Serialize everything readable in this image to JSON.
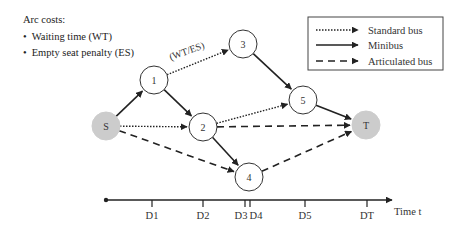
{
  "arc_costs": {
    "title": "Arc costs:",
    "items": [
      "Waiting time (WT)",
      "Empty seat penalty (ES)"
    ]
  },
  "edge_label": "(WT/ES)",
  "legend": {
    "items": [
      {
        "style": "dotted",
        "label": "Standard bus"
      },
      {
        "style": "solid",
        "label": "Minibus"
      },
      {
        "style": "dashed",
        "label": "Articulated bus"
      }
    ]
  },
  "nodes": [
    {
      "id": "S",
      "label": "S",
      "x": 106,
      "y": 126,
      "fill": "#cccccc"
    },
    {
      "id": "1",
      "label": "1",
      "x": 154,
      "y": 80,
      "fill": "#ffffff"
    },
    {
      "id": "2",
      "label": "2",
      "x": 203,
      "y": 127,
      "fill": "#ffffff"
    },
    {
      "id": "3",
      "label": "3",
      "x": 243,
      "y": 44,
      "fill": "#ffffff"
    },
    {
      "id": "4",
      "label": "4",
      "x": 249,
      "y": 177,
      "fill": "#ffffff"
    },
    {
      "id": "5",
      "label": "5",
      "x": 303,
      "y": 100,
      "fill": "#ffffff"
    },
    {
      "id": "T",
      "label": "T",
      "x": 366,
      "y": 125,
      "fill": "#cccccc"
    }
  ],
  "edges": [
    {
      "from": "S",
      "to": "1",
      "type": "solid"
    },
    {
      "from": "S",
      "to": "2",
      "type": "dotted"
    },
    {
      "from": "S",
      "to": "4",
      "type": "dashed"
    },
    {
      "from": "1",
      "to": "3",
      "type": "dotted"
    },
    {
      "from": "1",
      "to": "2",
      "type": "solid"
    },
    {
      "from": "2",
      "to": "5",
      "type": "dotted"
    },
    {
      "from": "2",
      "to": "T",
      "type": "dashed"
    },
    {
      "from": "2",
      "to": "4",
      "type": "solid"
    },
    {
      "from": "3",
      "to": "5",
      "type": "solid"
    },
    {
      "from": "5",
      "to": "T",
      "type": "solid"
    },
    {
      "from": "4",
      "to": "T",
      "type": "dashed"
    }
  ],
  "timeline": {
    "axis_label": "Time t",
    "ticks": [
      {
        "label": "D1",
        "x": 152
      },
      {
        "label": "D2",
        "x": 203
      },
      {
        "label": "D3",
        "x": 245
      },
      {
        "label": "D4",
        "x": 250
      },
      {
        "label": "D5",
        "x": 305
      },
      {
        "label": "DT",
        "x": 367
      }
    ]
  }
}
